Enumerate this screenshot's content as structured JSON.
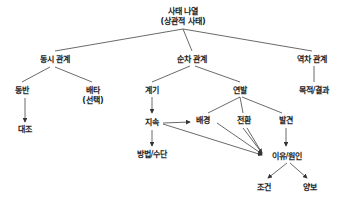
{
  "diagram": {
    "type": "tree",
    "nodes": {
      "root": {
        "line1": "사태 나열",
        "line2": "(상관적 사태)"
      },
      "simultaneous": {
        "label": "동시 관계"
      },
      "sequential": {
        "label": "순차 관계"
      },
      "reverse": {
        "label": "역차 관계"
      },
      "accompany": {
        "label": "동반"
      },
      "exclusive": {
        "line1": "배타",
        "line2": "(선택)"
      },
      "contrast": {
        "label": "대조"
      },
      "trigger": {
        "label": "계기"
      },
      "chain": {
        "label": "연발"
      },
      "purpose_result": {
        "label": "목적/결과"
      },
      "continuation": {
        "label": "지속"
      },
      "background": {
        "label": "배경"
      },
      "transition": {
        "label": "전환"
      },
      "development": {
        "label": "발견"
      },
      "method_means": {
        "label": "방법/수단"
      },
      "reason_cause": {
        "label": "이유/원인"
      },
      "condition": {
        "label": "조건"
      },
      "concession": {
        "label": "양보"
      }
    },
    "edges": [
      [
        "root",
        "simultaneous"
      ],
      [
        "root",
        "sequential"
      ],
      [
        "root",
        "reverse"
      ],
      [
        "simultaneous",
        "accompany"
      ],
      [
        "simultaneous",
        "exclusive"
      ],
      [
        "accompany",
        "contrast"
      ],
      [
        "sequential",
        "trigger"
      ],
      [
        "sequential",
        "chain"
      ],
      [
        "reverse",
        "purpose_result"
      ],
      [
        "trigger",
        "continuation"
      ],
      [
        "chain",
        "background"
      ],
      [
        "chain",
        "transition"
      ],
      [
        "chain",
        "development"
      ],
      [
        "continuation",
        "background"
      ],
      [
        "continuation",
        "method_means"
      ],
      [
        "continuation",
        "reason_cause"
      ],
      [
        "background",
        "reason_cause"
      ],
      [
        "transition",
        "reason_cause"
      ],
      [
        "development",
        "reason_cause"
      ],
      [
        "reason_cause",
        "condition"
      ],
      [
        "reason_cause",
        "concession"
      ]
    ],
    "colors": {
      "line": "#444444",
      "text": "#222222",
      "background": "#ffffff"
    }
  }
}
